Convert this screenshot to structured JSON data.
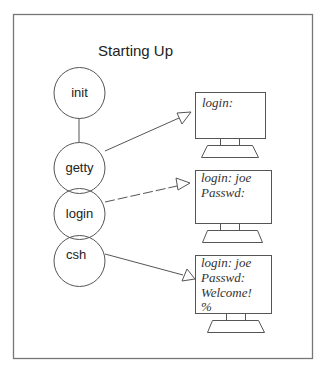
{
  "diagram": {
    "title": "Starting Up",
    "processes": [
      {
        "id": "init",
        "label": "init"
      },
      {
        "id": "getty",
        "label": "getty"
      },
      {
        "id": "login",
        "label": "login"
      },
      {
        "id": "csh",
        "label": "csh"
      }
    ],
    "terminals": [
      {
        "id": "terminal-1",
        "lines": [
          "login:"
        ]
      },
      {
        "id": "terminal-2",
        "lines": [
          "login: joe",
          "Passwd:"
        ]
      },
      {
        "id": "terminal-3",
        "lines": [
          "login: joe",
          "Passwd:",
          "Welcome!",
          "%"
        ]
      }
    ],
    "connections": [
      {
        "from": "init",
        "to": "getty",
        "style": "solid-line"
      },
      {
        "from": "getty",
        "to": "terminal-1",
        "style": "solid-arrow"
      },
      {
        "from": "login",
        "to": "terminal-2",
        "style": "dashed-arrow"
      },
      {
        "from": "csh",
        "to": "terminal-3",
        "style": "solid-arrow"
      }
    ]
  }
}
